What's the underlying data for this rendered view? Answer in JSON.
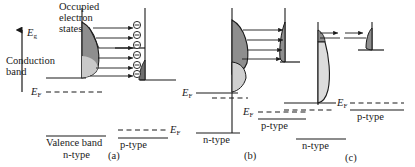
{
  "figure": {
    "title_caption": "Tunnel (Esaki) diode energy band diagrams under increasing forward bias",
    "type": "diagram",
    "panels": [
      {
        "id": "a",
        "caption": "(a)",
        "annotations": {
          "band_gap": "E",
          "band_gap_sub": "g",
          "occupied_states": "Occupied\nelectron\nstates",
          "occupied_states_l1": "Occupied",
          "occupied_states_l2": "electron",
          "occupied_states_l3": "states",
          "conduction_band_l1": "Conduction",
          "conduction_band_l2": "band",
          "valence_band": "Valence band",
          "fermi_n": "E",
          "fermi_n_sub": "F",
          "fermi_p": "E",
          "fermi_p_sub": "F",
          "ntype": "n-type",
          "ptype": "p-type"
        },
        "electron_symbols": 6,
        "tunnel_arrows": 6,
        "arrow_direction": "right"
      },
      {
        "id": "b",
        "caption": "(b)",
        "annotations": {
          "fermi_n": "E",
          "fermi_n_sub": "F",
          "fermi_p": "E",
          "fermi_p_sub": "F",
          "ntype": "n-type",
          "ptype": "p-type"
        },
        "electron_symbols": 0,
        "tunnel_arrows": 4,
        "arrow_direction": "right"
      },
      {
        "id": "c",
        "caption": "(c)",
        "annotations": {
          "fermi_np": "E",
          "fermi_np_sub": "F",
          "ntype": "n-type",
          "ptype": "p-type"
        },
        "electron_symbols": 0,
        "tunnel_arrows": 2,
        "arrow_direction": "right-pair"
      }
    ],
    "colors": {
      "stroke": "#1a1a1a",
      "fill_dark": "#8e8e8e",
      "fill_light": "#d6d6d6",
      "background": "#ffffff"
    },
    "symbols": {
      "electron": "electron-minus-circle",
      "arrow": "tunneling-arrow"
    }
  }
}
